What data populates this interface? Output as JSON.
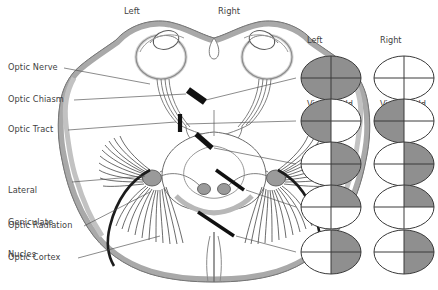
{
  "figure": {
    "type": "anatomical-diagram",
    "background": "#ffffff",
    "ink": "#3f3f3f"
  },
  "orientation_labels": [
    {
      "name": "left",
      "text": "Left",
      "x": 124,
      "y": 8
    },
    {
      "name": "right",
      "text": "Right",
      "x": 218,
      "y": 8
    }
  ],
  "structure_labels": [
    {
      "key": "optic-nerve",
      "lines": [
        "Optic Nerve"
      ],
      "x": 8,
      "y": 64
    },
    {
      "key": "optic-chiasm",
      "lines": [
        "Optic Chiasm"
      ],
      "x": 8,
      "y": 96
    },
    {
      "key": "optic-tract",
      "lines": [
        "Optic Tract"
      ],
      "x": 8,
      "y": 126
    },
    {
      "key": "lateral-geniculate-nucles",
      "lines": [
        "Lateral",
        "Geniculate",
        "Nucles"
      ],
      "x": 8,
      "y": 166
    },
    {
      "key": "optic-radiation",
      "lines": [
        "Optic Radiation"
      ],
      "x": 8,
      "y": 222
    },
    {
      "key": "optic-cortex",
      "lines": [
        "Optic Cortex"
      ],
      "x": 8,
      "y": 255
    }
  ],
  "column_headers": [
    {
      "key": "left-monocular",
      "lines": [
        "Left",
        "Monocular",
        "Visual Field"
      ],
      "x": 307,
      "y": 17
    },
    {
      "key": "right-monocular",
      "lines": [
        "Right",
        "Monocular",
        "Visual Field"
      ],
      "x": 380,
      "y": 17
    }
  ],
  "field_colors": {
    "shaded": "#8f8f8f",
    "unshaded": "#ffffff",
    "outline": "#3a3a3a",
    "cross": "#3a3a3a"
  },
  "chart_data": {
    "type": "table",
    "columns": [
      "Lesion site",
      "Left Monocular Visual Field",
      "Right Monocular Visual Field"
    ],
    "quadrant_order": [
      "upper-left",
      "upper-right",
      "lower-left",
      "lower-right"
    ],
    "rows": [
      {
        "lesion": "optic-nerve",
        "row_y": 78,
        "left": {
          "pattern": "full",
          "quadrants": [
            1,
            1,
            1,
            1
          ]
        },
        "right": {
          "pattern": "none",
          "quadrants": [
            0,
            0,
            0,
            0
          ]
        }
      },
      {
        "lesion": "optic-chiasm",
        "row_y": 121,
        "left": {
          "pattern": "left-half",
          "quadrants": [
            1,
            0,
            1,
            0
          ]
        },
        "right": {
          "pattern": "left-half",
          "quadrants": [
            1,
            0,
            1,
            0
          ]
        }
      },
      {
        "lesion": "optic-tract",
        "row_y": 164,
        "left": {
          "pattern": "right-half",
          "quadrants": [
            0,
            1,
            0,
            1
          ]
        },
        "right": {
          "pattern": "right-half",
          "quadrants": [
            0,
            1,
            0,
            1
          ]
        }
      },
      {
        "lesion": "optic-radiation",
        "row_y": 207,
        "left": {
          "pattern": "upper-right-quadrant",
          "quadrants": [
            0,
            1,
            0,
            0
          ]
        },
        "right": {
          "pattern": "upper-right-quadrant",
          "quadrants": [
            0,
            1,
            0,
            0
          ]
        }
      },
      {
        "lesion": "optic-cortex",
        "row_y": 252,
        "left": {
          "pattern": "right-half",
          "quadrants": [
            0,
            1,
            0,
            1
          ]
        },
        "right": {
          "pattern": "right-half",
          "quadrants": [
            0,
            1,
            0,
            1
          ]
        }
      }
    ],
    "column_x": {
      "left": 331,
      "right": 404
    },
    "ellipse_rx": 30,
    "ellipse_ry": 22
  },
  "lesion_markers": [
    {
      "key": "optic-nerve-lesion",
      "x": 196,
      "y": 96,
      "angle": 118
    },
    {
      "key": "optic-chiasm-lesion",
      "x": 180,
      "y": 123,
      "angle": 92
    },
    {
      "key": "optic-tract-lesion",
      "x": 204,
      "y": 141,
      "angle": 150
    },
    {
      "key": "optic-radiation-lesion",
      "x": 229,
      "y": 180,
      "angle": 158
    },
    {
      "key": "optic-cortex-lesion",
      "x": 215,
      "y": 224,
      "angle": 150
    }
  ]
}
